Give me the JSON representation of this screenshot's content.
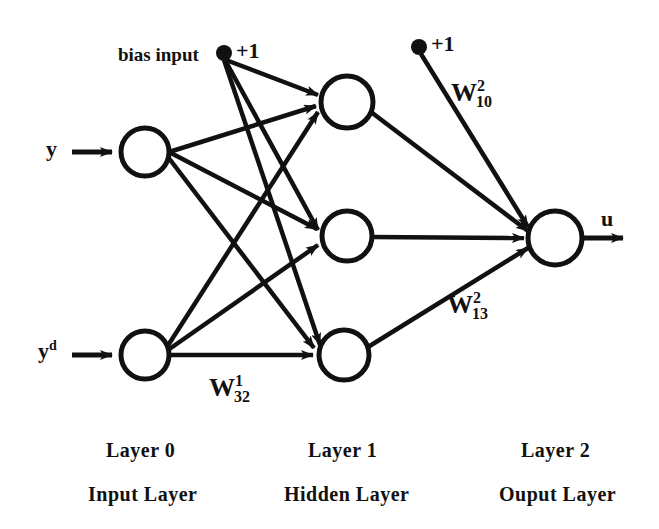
{
  "diagram": {
    "stroke_color": "#111111",
    "background": "#ffffff",
    "bias": {
      "layer1_label_text": "bias input",
      "layer1_value": "+1",
      "layer2_value": "+1"
    },
    "inputs": [
      {
        "id": "input-y",
        "label": "y",
        "superscript": ""
      },
      {
        "id": "input-yd",
        "label": "y",
        "superscript": "d"
      }
    ],
    "output": {
      "id": "output-u",
      "label": "u"
    },
    "weights": [
      {
        "id": "w-32-1",
        "symbol": "W",
        "superscript": "1",
        "subscript": "32"
      },
      {
        "id": "w-10-2",
        "symbol": "W",
        "superscript": "2",
        "subscript": "10"
      },
      {
        "id": "w-13-2",
        "symbol": "W",
        "superscript": "2",
        "subscript": "13"
      }
    ],
    "layers": [
      {
        "id": "layer-0",
        "number_label": "Layer  0",
        "name_label": "Input  Layer"
      },
      {
        "id": "layer-1",
        "number_label": "Layer  1",
        "name_label": "Hidden  Layer"
      },
      {
        "id": "layer-2",
        "number_label": "Layer  2",
        "name_label": "Ouput  Layer"
      }
    ],
    "nodes": {
      "input_layer": [
        {
          "id": "node-input-1",
          "cx": 145,
          "cy": 152,
          "r": 24
        },
        {
          "id": "node-input-2",
          "cx": 145,
          "cy": 355,
          "r": 24
        }
      ],
      "hidden_layer": [
        {
          "id": "node-hidden-1",
          "cx": 347,
          "cy": 102,
          "r": 26
        },
        {
          "id": "node-hidden-2",
          "cx": 347,
          "cy": 236,
          "r": 25
        },
        {
          "id": "node-hidden-3",
          "cx": 344,
          "cy": 355,
          "r": 25
        }
      ],
      "output_layer": [
        {
          "id": "node-output-1",
          "cx": 555,
          "cy": 238,
          "r": 27
        }
      ]
    }
  }
}
